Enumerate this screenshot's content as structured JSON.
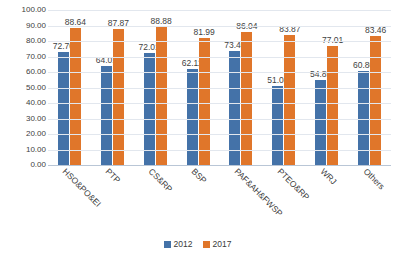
{
  "chart_data": {
    "type": "bar",
    "title": "",
    "subtitle": "",
    "xlabel": "",
    "ylabel": "",
    "ylim": [
      0,
      100
    ],
    "ytick_step": 10,
    "ytick_labels": [
      "100.00",
      "90.00",
      "80.00",
      "70.00",
      "60.00",
      "50.00",
      "40.00",
      "30.00",
      "20.00",
      "10.00",
      "0.00"
    ],
    "grid": true,
    "legend_position": "bottom-center",
    "categories": [
      "HSO&PO&EI",
      "PTP",
      "CS&RP",
      "BSP",
      "PAF&AH&FWSP",
      "PTEO&RP",
      "WRJ",
      "Others"
    ],
    "series": [
      {
        "name": "2012",
        "color": "#4472a8",
        "values": [
          72.7,
          64.01,
          72.01,
          62.11,
          73.4,
          51.08,
          54.85,
          60.8
        ],
        "labels": [
          "72.70",
          "64.01",
          "72.01",
          "62.11",
          "73.40",
          "51.08",
          "54.85",
          "60.80"
        ]
      },
      {
        "name": "2017",
        "color": "#e0762a",
        "values": [
          88.64,
          87.87,
          88.88,
          81.99,
          86.04,
          83.87,
          77.01,
          83.46
        ],
        "labels": [
          "88.64",
          "87.87",
          "88.88",
          "81.99",
          "86.04",
          "83.87",
          "77.01",
          "83.46"
        ]
      }
    ]
  },
  "legend": {
    "items": [
      {
        "label": "2012",
        "color": "#4472a8"
      },
      {
        "label": "2017",
        "color": "#e0762a"
      }
    ]
  },
  "colors": {
    "series_2012": "#4472a8",
    "series_2017": "#e0762a",
    "gridline": "#e2e7ee",
    "axis": "#b9c6d6",
    "text": "#3a3a3a",
    "background": "#ffffff"
  }
}
